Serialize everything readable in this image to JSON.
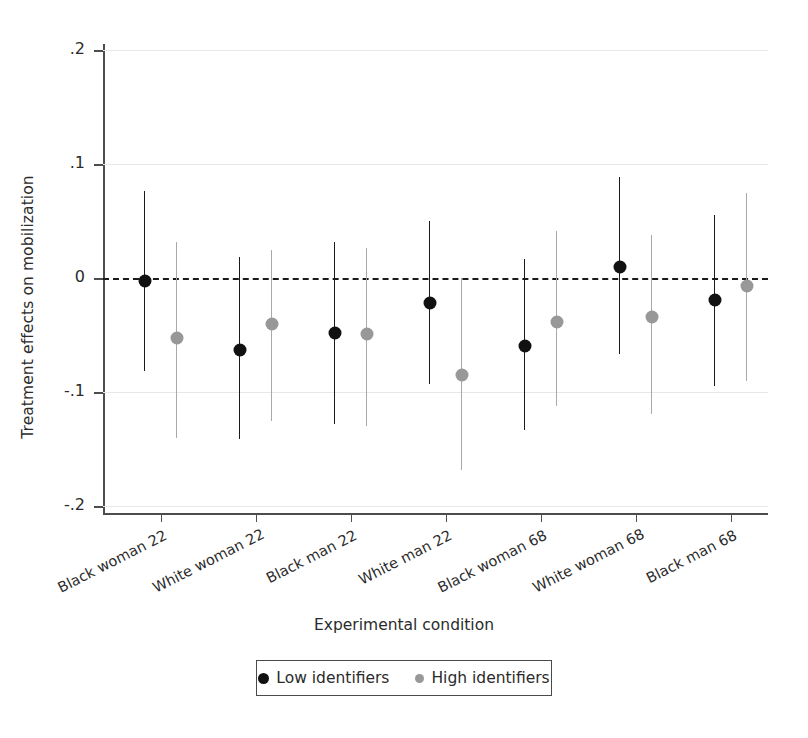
{
  "chart_data": {
    "type": "scatter",
    "title": "",
    "xlabel": "Experimental condition",
    "ylabel": "Treatment effects on mobilization",
    "ylim": [
      -0.2,
      0.2
    ],
    "yticks": [
      ".2",
      ".1",
      "0",
      "-.1",
      "-.2"
    ],
    "ytick_values": [
      0.2,
      0.1,
      0,
      -0.1,
      -0.2
    ],
    "grid": "horizontal",
    "reference_line": 0,
    "legend_position": "bottom",
    "categories": [
      "Black woman 22",
      "White woman 22",
      "Black man 22",
      "White man 22",
      "Black woman 68",
      "White woman 68",
      "Black man 68"
    ],
    "series": [
      {
        "name": "Low identifiers",
        "color": "#111111",
        "values": [
          -0.003,
          -0.063,
          -0.048,
          -0.022,
          -0.06,
          0.01,
          -0.019
        ],
        "ci_low": [
          -0.082,
          -0.141,
          -0.128,
          -0.093,
          -0.133,
          -0.067,
          -0.095
        ],
        "ci_high": [
          0.076,
          0.018,
          0.032,
          0.05,
          0.017,
          0.089,
          0.055
        ]
      },
      {
        "name": "High identifiers",
        "color": "#989898",
        "values": [
          -0.053,
          -0.04,
          -0.049,
          -0.085,
          -0.039,
          -0.034,
          -0.007
        ],
        "ci_low": [
          -0.14,
          -0.125,
          -0.13,
          -0.168,
          -0.112,
          -0.119,
          -0.09
        ],
        "ci_high": [
          0.032,
          0.025,
          0.026,
          0.0,
          0.041,
          0.038,
          0.075
        ]
      }
    ]
  },
  "legend": {
    "items": [
      {
        "label": "Low identifiers",
        "marker": "filled-circle-black"
      },
      {
        "label": "High identifiers",
        "marker": "filled-circle-gray"
      }
    ]
  }
}
